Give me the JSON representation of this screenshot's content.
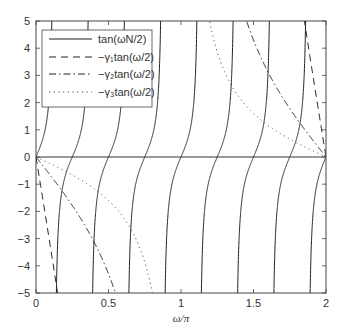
{
  "chart_data": {
    "type": "line",
    "title": "",
    "xlabel": "ω/π",
    "ylabel": "",
    "xlim": [
      0,
      2
    ],
    "ylim": [
      -5,
      5
    ],
    "grid": false,
    "legend_position": "upper left",
    "xticks": [
      0,
      0.5,
      1,
      1.5,
      2
    ],
    "xtick_labels": [
      "0",
      "0.5",
      "1",
      "1.5",
      "2"
    ],
    "yticks": [
      -5,
      -4,
      -3,
      -2,
      -1,
      0,
      1,
      2,
      3,
      4,
      5
    ],
    "ytick_labels": [
      "−5",
      "−4",
      "−3",
      "−2",
      "−1",
      "0",
      "1",
      "2",
      "3",
      "4",
      "5"
    ],
    "series": [
      {
        "name": "tan(ωN/2)",
        "style": "solid",
        "function": "tan(N*w/2)",
        "N": 8,
        "zero_crossings_w_over_pi": [
          0,
          0.25,
          0.5,
          0.75,
          1,
          1.25,
          1.5,
          1.75,
          2
        ]
      },
      {
        "name": "−γ₁tan(ω/2)",
        "style": "dashed",
        "function": "-g*tan(w/2)",
        "gamma": 21
      },
      {
        "name": "−γ₂tan(ω/2)",
        "style": "dashdot",
        "function": "-g*tan(w/2)",
        "gamma": 4.3
      },
      {
        "name": "−γ₃tan(ω/2)",
        "style": "dotted",
        "function": "-g*tan(w/2)",
        "gamma": 1.6
      }
    ],
    "reference_lines": [
      {
        "y": 0,
        "style": "solid"
      }
    ]
  },
  "legend": {
    "items": [
      {
        "label": "tan(ωN/2)",
        "style": "solid"
      },
      {
        "label": "−γ₁tan(ω/2)",
        "style": "dashed"
      },
      {
        "label": "−γ₂tan(ω/2)",
        "style": "dashdot"
      },
      {
        "label": "−γ₃tan(ω/2)",
        "style": "dotted"
      }
    ]
  },
  "colors": {
    "line": "#222222",
    "axis": "#444444",
    "background": "#ffffff"
  }
}
